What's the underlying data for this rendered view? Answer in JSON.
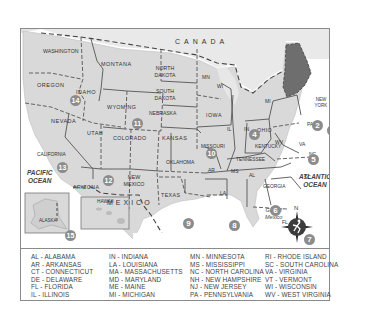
{
  "map": {
    "country_label": "CANADA",
    "mexico_label": "MEXICO",
    "pacific_label": [
      "PACIFIC",
      "OCEAN"
    ],
    "atlantic_label": [
      "ATLANTIC",
      "OCEAN"
    ],
    "gulf_label": [
      "Gulf of",
      "Mexico"
    ],
    "compass_north": "N",
    "colors": {
      "land": "#d9d9d9",
      "water": "#ffffff",
      "highlight": "#6e6e6e",
      "border": "#555555",
      "badge": "#8c8c8c",
      "frame": "#8a8a8a"
    },
    "states": [
      {
        "label": "WASHINGTON"
      },
      {
        "label": "OREGON"
      },
      {
        "label": "CALIFORNIA"
      },
      {
        "label": "IDAHO"
      },
      {
        "label": "NEVADA"
      },
      {
        "label": "MONTANA"
      },
      {
        "label": "WYOMING"
      },
      {
        "label": "UTAH"
      },
      {
        "label": "ARIZONA"
      },
      {
        "label": "COLORADO"
      },
      {
        "label": "NEW MEXICO"
      },
      {
        "label": "NORTH DAKOTA"
      },
      {
        "label": "SOUTH DAKOTA"
      },
      {
        "label": "NEBRASKA"
      },
      {
        "label": "KANSAS"
      },
      {
        "label": "OKLAHOMA"
      },
      {
        "label": "TEXAS"
      },
      {
        "label": "MN"
      },
      {
        "label": "IOWA"
      },
      {
        "label": "MISSOURI"
      },
      {
        "label": "AR"
      },
      {
        "label": "LA"
      },
      {
        "label": "WI"
      },
      {
        "label": "IL"
      },
      {
        "label": "MS"
      },
      {
        "label": "MI"
      },
      {
        "label": "IN"
      },
      {
        "label": "KENTUCKY"
      },
      {
        "label": "TENNESSEE"
      },
      {
        "label": "AL"
      },
      {
        "label": "GEORGIA"
      },
      {
        "label": "FL"
      },
      {
        "label": "OHIO"
      },
      {
        "label": "WV"
      },
      {
        "label": "VA"
      },
      {
        "label": "NC"
      },
      {
        "label": "SC"
      },
      {
        "label": "PA"
      },
      {
        "label": "NEW YORK"
      },
      {
        "label": "VT"
      },
      {
        "label": "NH"
      },
      {
        "label": "ME"
      },
      {
        "label": "MA"
      },
      {
        "label": "RI"
      },
      {
        "label": "CT"
      },
      {
        "label": "NJ"
      },
      {
        "label": "DE"
      },
      {
        "label": "MD"
      },
      {
        "label": "ALASKA"
      },
      {
        "label": "HAWAII"
      }
    ],
    "regions": [
      {
        "number": "1"
      },
      {
        "number": "2"
      },
      {
        "number": "3"
      },
      {
        "number": "4"
      },
      {
        "number": "5"
      },
      {
        "number": "6"
      },
      {
        "number": "7"
      },
      {
        "number": "8"
      },
      {
        "number": "9"
      },
      {
        "number": "10"
      },
      {
        "number": "11"
      },
      {
        "number": "12"
      },
      {
        "number": "13"
      },
      {
        "number": "14"
      },
      {
        "number": "15"
      },
      {
        "number": "16"
      }
    ]
  },
  "legend": {
    "columns": [
      [
        "AL - ALABAMA",
        "AR - ARKANSAS",
        "CT - CONNECTICUT",
        "DE - DELAWARE",
        "FL - FLORIDA",
        "IL - ILLINOIS"
      ],
      [
        "IN - INDIANA",
        "LA - LOUISIANA",
        "MA - MASSACHUSETTS",
        "MD - MARYLAND",
        "ME - MAINE",
        "MI - MICHIGAN"
      ],
      [
        "MN - MINNESOTA",
        "MS - MISSISSIPPI",
        "NC - NORTH CAROLINA",
        "NH - NEW HAMPSHIRE",
        "NJ - NEW JERSEY",
        "PA - PENNSYLVANIA"
      ],
      [
        "RI - RHODE ISLAND",
        "SC - SOUTH CAROLINA",
        "VA - VIRGINIA",
        "VT - VERMONT",
        "WI - WISCONSIN",
        "WV - WEST VIRGINIA"
      ]
    ]
  }
}
